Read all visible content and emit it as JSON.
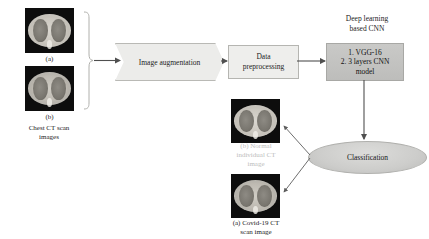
{
  "diagram": {
    "input_group": {
      "image_a_label": "(a)",
      "image_b_label": "(b)",
      "caption": "Chest CT scan\nimages"
    },
    "stages": {
      "augmentation_label": "Image augmentation",
      "preprocessing_label": "Data\npreprocessing",
      "cnn_heading": "Deep learning\nbased CNN",
      "cnn_box_label": "1. VGG-16\n2. 3 layers CNN\nmodel",
      "classification_label": "Classification"
    },
    "outputs": {
      "normal_caption": "(b) Normal\nindividual CT\nimage",
      "covid_caption": "(a) Covid-19 CT\nscan image"
    },
    "colors": {
      "background": "#ffffff",
      "shape_fill_light": "#ececea",
      "shape_fill_gray": "#c3c3c1",
      "shape_border": "#b3b3af",
      "text": "#1c1c1c",
      "faded_text": "#bdbdbd",
      "connector": "#5a5a5a",
      "ct_background": "#0d0d0d"
    }
  }
}
